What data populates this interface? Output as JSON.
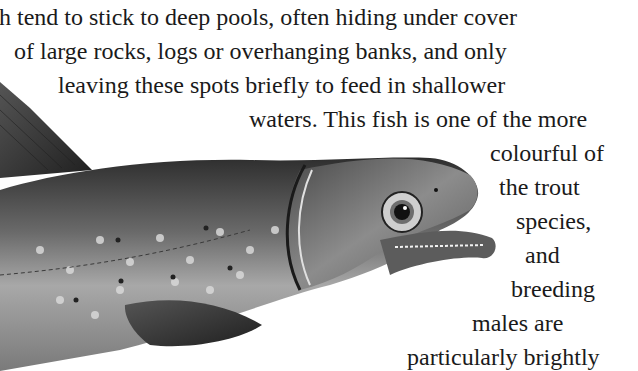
{
  "document": {
    "text_lines": [
      {
        "text": "h tend to stick to deep pools, often hiding under cover",
        "x": -1,
        "y": 3
      },
      {
        "text": "of large rocks, logs or overhanging banks, and only",
        "x": 14,
        "y": 37
      },
      {
        "text": "leaving these spots briefly to feed in shallower",
        "x": 58,
        "y": 71
      },
      {
        "text": "waters. This fish is one of the more",
        "x": 249,
        "y": 105
      },
      {
        "text": "colourful of",
        "x": 490,
        "y": 139
      },
      {
        "text": "the trout",
        "x": 499,
        "y": 173
      },
      {
        "text": "species,",
        "x": 516,
        "y": 207
      },
      {
        "text": "and",
        "x": 525,
        "y": 241
      },
      {
        "text": "breeding",
        "x": 511,
        "y": 275
      },
      {
        "text": "males are",
        "x": 472,
        "y": 309
      },
      {
        "text": "particularly brightly",
        "x": 407,
        "y": 343
      }
    ],
    "illustration": {
      "subject": "brook trout",
      "style": "grayscale engraving"
    }
  }
}
